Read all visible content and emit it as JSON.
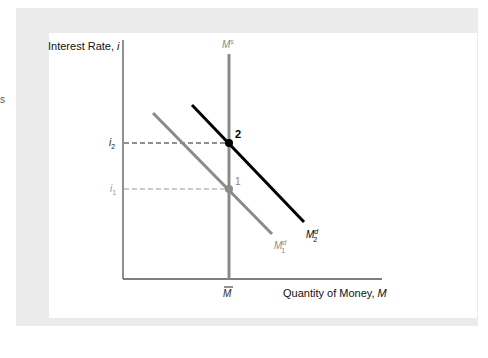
{
  "page_fragment": "s",
  "diagram": {
    "y_axis_label": "Interest Rate, ",
    "y_axis_var": "i",
    "x_axis_label": "Quantity of Money, ",
    "x_axis_var": "M",
    "supply_label": "M",
    "supply_sup": "s",
    "x_tick_label": "M",
    "y_ticks": [
      {
        "label": "i",
        "sub": "2"
      },
      {
        "label": "i",
        "sub": "1"
      }
    ],
    "curves": [
      {
        "name": "M",
        "sup": "d",
        "sub": "1",
        "color": "#8a8a8a"
      },
      {
        "name": "M",
        "sup": "d",
        "sub": "2",
        "color": "#000000"
      }
    ],
    "points": [
      {
        "label": "1",
        "color": "#8a8a8a"
      },
      {
        "label": "2",
        "color": "#000000"
      }
    ],
    "colors": {
      "frame": "#ebebeb",
      "axis": "#555555",
      "supply": "#8a8a8a",
      "md1": "#8a8a8a",
      "md2": "#000000"
    }
  }
}
